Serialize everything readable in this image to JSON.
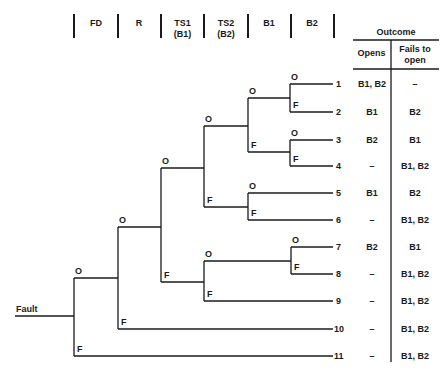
{
  "headers": [
    {
      "label": "FD",
      "sub": ""
    },
    {
      "label": "R",
      "sub": ""
    },
    {
      "label": "TS1",
      "sub": "(B1)"
    },
    {
      "label": "TS2",
      "sub": "(B2)"
    },
    {
      "label": "B1",
      "sub": ""
    },
    {
      "label": "B2",
      "sub": ""
    }
  ],
  "initiating_event": "Fault",
  "branch_labels": {
    "open": "O",
    "fail": "F"
  },
  "outcome_table": {
    "title": "Outcome",
    "col_opens": "Opens",
    "col_fails": "Fails to open"
  },
  "outcomes": [
    {
      "id": "1",
      "opens": "B1, B2",
      "fails": "–"
    },
    {
      "id": "2",
      "opens": "B1",
      "fails": "B2"
    },
    {
      "id": "3",
      "opens": "B2",
      "fails": "B1"
    },
    {
      "id": "4",
      "opens": "–",
      "fails": "B1, B2"
    },
    {
      "id": "5",
      "opens": "B1",
      "fails": "B2"
    },
    {
      "id": "6",
      "opens": "–",
      "fails": "B1, B2"
    },
    {
      "id": "7",
      "opens": "B2",
      "fails": "B1"
    },
    {
      "id": "8",
      "opens": "–",
      "fails": "B1, B2"
    },
    {
      "id": "9",
      "opens": "–",
      "fails": "B1, B2"
    },
    {
      "id": "10",
      "opens": "–",
      "fails": "B1, B2"
    },
    {
      "id": "11",
      "opens": "–",
      "fails": "B1, B2"
    }
  ],
  "colors": {
    "ink": "#1a1a1a",
    "background": "#ffffff"
  }
}
